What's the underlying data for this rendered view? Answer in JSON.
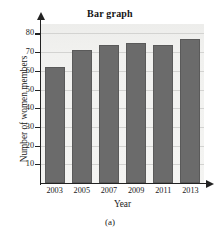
{
  "chart_data": {
    "type": "bar",
    "title": "Bar graph",
    "xlabel": "Year",
    "ylabel": "Number of women members",
    "categories": [
      "2003",
      "2005",
      "2007",
      "2009",
      "2011",
      "2013"
    ],
    "values": [
      62,
      71,
      74,
      75,
      74,
      77
    ],
    "ylim": [
      0,
      85
    ],
    "yticks": [
      10,
      20,
      30,
      40,
      50,
      60,
      70,
      80
    ],
    "ytick_labels": [
      "10",
      "20",
      "30",
      "40",
      "50",
      "60",
      "70",
      "80"
    ],
    "grid": true,
    "gridlines_at": [
      10,
      20,
      30,
      40,
      50,
      60,
      70,
      80
    ],
    "legend": null,
    "legend_position": "none",
    "bar_color": "#6b6b6b",
    "plot_background": "#f2f2f0",
    "axis_color": "#222222",
    "gridline_color": "#d3d3d1"
  },
  "figure": {
    "caption": "(a)"
  }
}
